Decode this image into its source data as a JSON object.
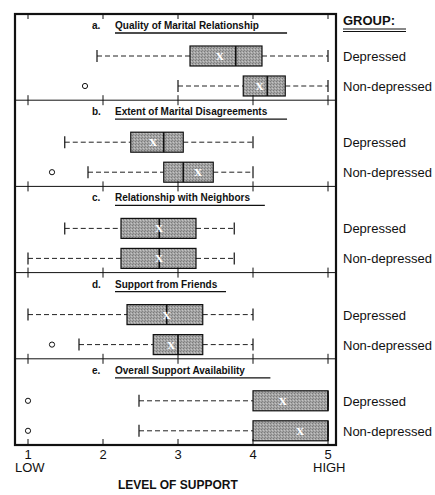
{
  "chart_data": {
    "type": "boxplot",
    "title": "",
    "xlabel": "LEVEL OF SUPPORT",
    "xlim": [
      1,
      5
    ],
    "x_ticks": [
      1,
      2,
      3,
      4,
      5
    ],
    "x_tick_labels": [
      "1",
      "2",
      "3",
      "4",
      "5"
    ],
    "x_end_labels": {
      "low": "LOW",
      "high": "HIGH"
    },
    "legend": {
      "title": "GROUP:",
      "placement": "right",
      "groups": [
        "Depressed",
        "Non-depressed"
      ]
    },
    "colors": {
      "box_fill": "#9c9c9c",
      "line": "#111111",
      "mean_marker": "#ffffff"
    },
    "mean_marker_symbol": "X",
    "panels": [
      {
        "letter": "a.",
        "title": "Quality of Marital Relationship",
        "series": [
          {
            "name": "Depressed",
            "whisker_low": 1.92,
            "q1": 3.16,
            "median": 3.77,
            "q3": 4.12,
            "whisker_high": 5.0,
            "mean": 3.56,
            "outliers": []
          },
          {
            "name": "Non-depressed",
            "whisker_low": 3.0,
            "q1": 3.87,
            "median": 4.19,
            "q3": 4.43,
            "whisker_high": 5.0,
            "mean": 4.09,
            "outliers": [
              1.76
            ]
          }
        ]
      },
      {
        "letter": "b.",
        "title": "Extent of Marital Disagreements",
        "series": [
          {
            "name": "Depressed",
            "whisker_low": 1.49,
            "q1": 2.37,
            "median": 2.81,
            "q3": 3.07,
            "whisker_high": 4.0,
            "mean": 2.67,
            "outliers": []
          },
          {
            "name": "Non-depressed",
            "whisker_low": 1.8,
            "q1": 2.81,
            "median": 3.07,
            "q3": 3.47,
            "whisker_high": 4.0,
            "mean": 3.27,
            "outliers": [
              1.32
            ]
          }
        ]
      },
      {
        "letter": "c.",
        "title": "Relationship with Neighbors",
        "series": [
          {
            "name": "Depressed",
            "whisker_low": 1.49,
            "q1": 2.24,
            "median": 2.75,
            "q3": 3.24,
            "whisker_high": 3.75,
            "mean": 2.75,
            "outliers": []
          },
          {
            "name": "Non-depressed",
            "whisker_low": 1.0,
            "q1": 2.24,
            "median": 2.75,
            "q3": 3.24,
            "whisker_high": 3.75,
            "mean": 2.75,
            "outliers": []
          }
        ]
      },
      {
        "letter": "d.",
        "title": "Support from Friends",
        "series": [
          {
            "name": "Depressed",
            "whisker_low": 1.0,
            "q1": 2.32,
            "median": 2.85,
            "q3": 3.33,
            "whisker_high": 4.0,
            "mean": 2.85,
            "outliers": []
          },
          {
            "name": "Non-depressed",
            "whisker_low": 1.68,
            "q1": 2.67,
            "median": 3.0,
            "q3": 3.33,
            "whisker_high": 4.0,
            "mean": 2.91,
            "outliers": [
              1.32
            ]
          }
        ]
      },
      {
        "letter": "e.",
        "title": "Overall Support Availability",
        "series": [
          {
            "name": "Depressed",
            "whisker_low": 2.48,
            "q1": 4.0,
            "median": 5.0,
            "q3": 5.0,
            "whisker_high": 5.0,
            "mean": 4.4,
            "outliers": [
              1.0
            ]
          },
          {
            "name": "Non-depressed",
            "whisker_low": 2.48,
            "q1": 4.0,
            "median": 5.0,
            "q3": 5.0,
            "whisker_high": 5.0,
            "mean": 4.63,
            "outliers": [
              1.0
            ]
          }
        ]
      }
    ]
  }
}
